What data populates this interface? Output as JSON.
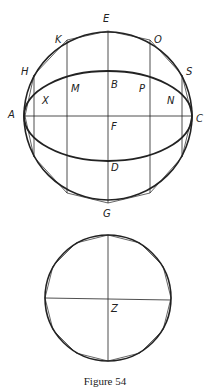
{
  "figure": {
    "caption": "Figure 54",
    "upper": {
      "labels": {
        "E": "E",
        "K": "K",
        "O": "O",
        "H": "H",
        "S": "S",
        "A": "A",
        "C": "C",
        "B": "B",
        "M": "M",
        "P": "P",
        "X": "X",
        "N": "N",
        "F": "F",
        "D": "D",
        "G": "G"
      }
    },
    "lower": {
      "labels": {
        "Z": "Z"
      }
    }
  }
}
